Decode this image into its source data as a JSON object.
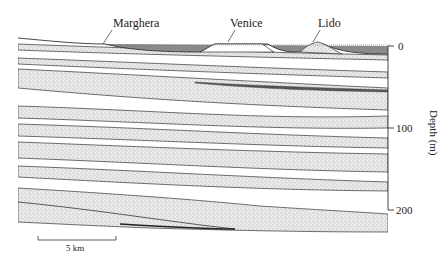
{
  "diagram": {
    "type": "geological cross-section",
    "place_labels": {
      "marghera": "Marghera",
      "venice": "Venice",
      "lido": "Lido"
    },
    "depth_axis": {
      "title": "Depth (m)",
      "ticks": [
        "0",
        "100",
        "200"
      ]
    },
    "scale_bar": {
      "label": "5 km"
    },
    "colors": {
      "sand_fill": "#d8d8d8",
      "lagoon_water": "#8a8a8a",
      "line": "#333333"
    }
  }
}
